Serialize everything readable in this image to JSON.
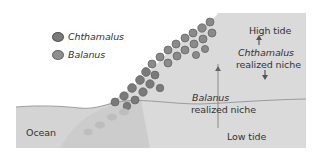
{
  "diagram": {
    "type": "ecological niche illustration (intertidal zone)",
    "legend": [
      {
        "label": "Chthamalus",
        "icon": "chthamalus-barnacle-icon",
        "color": "#7a7a7a"
      },
      {
        "label": "Balanus",
        "icon": "balanus-barnacle-icon",
        "color": "#8e8e8e"
      }
    ],
    "labels": {
      "high_tide": "High tide",
      "low_tide": "Low tide",
      "ocean": "Ocean",
      "chthamalus_name": "Chthamalus",
      "chthamalus_niche": "realized niche",
      "balanus_name": "Balanus",
      "balanus_niche": "realized niche"
    },
    "colors": {
      "background": "#ffffff",
      "rock": "#d9d9d9",
      "ocean": "#cfcfcf",
      "waterline": "#8a8a8a",
      "barnacle_dark": "#6f6f6f",
      "barnacle_light": "#9a9a9a",
      "text": "#333333"
    }
  }
}
